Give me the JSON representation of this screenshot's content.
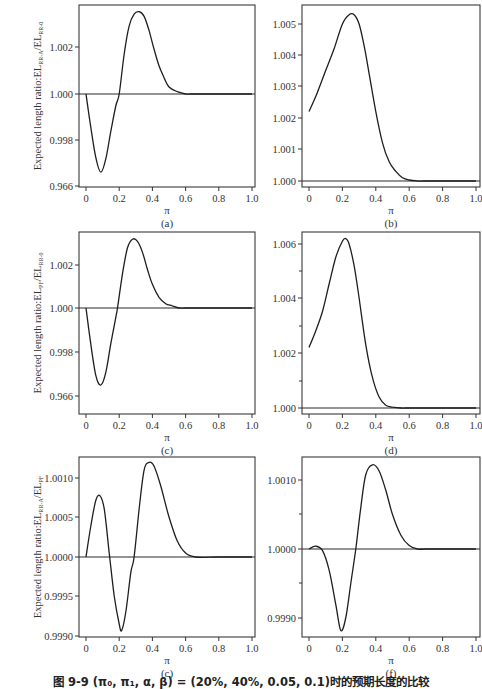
{
  "caption": "图 9-9 (π₀, π₁, α, β) = (20%, 40%, 0.05, 0.1)时的预期长度的比较",
  "chart_data": [
    {
      "id": "a",
      "type": "line",
      "panel_label": "(a)",
      "xlabel": "π",
      "ylabel": "Expected length ratio:EL_RR-A/EL_RR-0",
      "xlim": [
        0,
        1.0
      ],
      "xticks": [
        "0",
        "0.2",
        "0.4",
        "0.6",
        "0.8",
        "1.0"
      ],
      "yticks": [
        "0.966",
        "0.998",
        "1.000",
        "1.002"
      ],
      "reference_line": 1.0,
      "series": [
        {
          "name": "ratio",
          "x": [
            0,
            0.03,
            0.06,
            0.09,
            0.12,
            0.15,
            0.18,
            0.2,
            0.23,
            0.26,
            0.29,
            0.32,
            0.35,
            0.38,
            0.41,
            0.44,
            0.47,
            0.5,
            0.55,
            0.6,
            0.63,
            0.7,
            0.8,
            1.0
          ],
          "y": [
            1.0,
            0.9985,
            0.9972,
            0.9966,
            0.9972,
            0.9984,
            0.9995,
            1.0,
            1.0017,
            1.0029,
            1.0034,
            1.0035,
            1.0033,
            1.0027,
            1.0019,
            1.0012,
            1.0007,
            1.0003,
            1.0001,
            1.0,
            1.0,
            1.0,
            1.0,
            1.0
          ]
        }
      ]
    },
    {
      "id": "b",
      "type": "line",
      "panel_label": "(b)",
      "xlabel": "π",
      "ylabel": "",
      "xlim": [
        0,
        1.0
      ],
      "xticks": [
        "0",
        "0.2",
        "0.4",
        "0.6",
        "0.8",
        "1.0"
      ],
      "yticks": [
        "1.000",
        "1.001",
        "1.002",
        "1.003",
        "1.004",
        "1.005"
      ],
      "reference_line": 1.0,
      "series": [
        {
          "name": "ratio",
          "x": [
            0,
            0.05,
            0.1,
            0.15,
            0.2,
            0.24,
            0.27,
            0.3,
            0.33,
            0.36,
            0.4,
            0.44,
            0.48,
            0.52,
            0.56,
            0.6,
            0.65,
            0.7,
            1.0
          ],
          "y": [
            1.0022,
            1.0028,
            1.0035,
            1.0042,
            1.005,
            1.0053,
            1.0053,
            1.005,
            1.0043,
            1.0034,
            1.0022,
            1.0012,
            1.0006,
            1.0003,
            1.0001,
            1.00003,
            1.0,
            1.0,
            1.0
          ]
        }
      ]
    },
    {
      "id": "c",
      "type": "line",
      "panel_label": "(c)",
      "xlabel": "π",
      "ylabel": "Expected length ratio:EL_PF/EL_RR-0",
      "xlim": [
        0,
        1.0
      ],
      "xticks": [
        "0",
        "0.2",
        "0.4",
        "0.6",
        "0.8",
        "1.0"
      ],
      "yticks": [
        "0.966",
        "0.998",
        "1.000",
        "1.002"
      ],
      "reference_line": 1.0,
      "series": [
        {
          "name": "ratio",
          "x": [
            0,
            0.03,
            0.06,
            0.09,
            0.12,
            0.15,
            0.18,
            0.19,
            0.22,
            0.25,
            0.28,
            0.31,
            0.34,
            0.37,
            0.4,
            0.44,
            0.48,
            0.52,
            0.56,
            0.6,
            0.7,
            0.8,
            1.0
          ],
          "y": [
            1.0,
            0.9983,
            0.9969,
            0.9965,
            0.9971,
            0.9984,
            0.9996,
            1.0,
            1.0016,
            1.0028,
            1.0032,
            1.0031,
            1.0026,
            1.0018,
            1.0011,
            1.0005,
            1.0002,
            1.0001,
            1.0,
            1.0,
            1.0,
            1.0,
            1.0
          ]
        }
      ]
    },
    {
      "id": "d",
      "type": "line",
      "panel_label": "(d)",
      "xlabel": "π",
      "ylabel": "",
      "xlim": [
        0,
        1.0
      ],
      "xticks": [
        "0",
        "0.2",
        "0.4",
        "0.6",
        "0.8",
        "1.0"
      ],
      "yticks": [
        "1.000",
        "1.002",
        "1.004",
        "1.006"
      ],
      "reference_line": 1.0,
      "series": [
        {
          "name": "ratio",
          "x": [
            0,
            0.04,
            0.08,
            0.12,
            0.16,
            0.2,
            0.22,
            0.24,
            0.27,
            0.3,
            0.34,
            0.38,
            0.42,
            0.46,
            0.5,
            0.55,
            0.58,
            0.65,
            1.0
          ],
          "y": [
            1.0022,
            1.0028,
            1.0035,
            1.0045,
            1.0055,
            1.0061,
            1.0062,
            1.006,
            1.0052,
            1.004,
            1.0023,
            1.0011,
            1.0004,
            1.0001,
            1.00003,
            1.0,
            1.0,
            1.0,
            1.0
          ]
        }
      ]
    },
    {
      "id": "e",
      "type": "line",
      "panel_label": "(c)",
      "xlabel": "π",
      "ylabel": "Expected length ratio:EL_RR-A/EL_PF",
      "xlim": [
        0,
        1.0
      ],
      "xticks": [
        "0",
        "0.2",
        "0.4",
        "0.6",
        "0.8",
        "1.0"
      ],
      "yticks": [
        "0.9990",
        "0.9995",
        "1.0000",
        "1.0005",
        "1.0010"
      ],
      "reference_line": 1.0,
      "series": [
        {
          "name": "ratio",
          "x": [
            0,
            0.03,
            0.06,
            0.085,
            0.11,
            0.14,
            0.17,
            0.2,
            0.215,
            0.24,
            0.27,
            0.29,
            0.32,
            0.35,
            0.38,
            0.41,
            0.45,
            0.5,
            0.55,
            0.6,
            0.66,
            0.8,
            1.0
          ],
          "y": [
            1.0,
            1.0004,
            1.00072,
            1.00077,
            1.0006,
            1.00005,
            0.9995,
            0.99915,
            0.99907,
            0.9993,
            0.9998,
            1.0,
            1.0006,
            1.0011,
            1.0012,
            1.00115,
            1.0009,
            1.0005,
            1.0002,
            1.00005,
            1.0,
            1.0,
            1.0
          ]
        }
      ]
    },
    {
      "id": "f",
      "type": "line",
      "panel_label": "(f)",
      "xlabel": "π",
      "ylabel": "",
      "xlim": [
        0,
        1.0
      ],
      "xticks": [
        "0",
        "0.2",
        "0.4",
        "0.6",
        "0.8",
        "1.0"
      ],
      "yticks": [
        "0.9990",
        "1.0000",
        "1.0010"
      ],
      "reference_line": 1.0,
      "series": [
        {
          "name": "ratio",
          "x": [
            0,
            0.04,
            0.08,
            0.12,
            0.16,
            0.19,
            0.22,
            0.25,
            0.28,
            0.31,
            0.34,
            0.38,
            0.42,
            0.46,
            0.5,
            0.55,
            0.6,
            0.65,
            0.7,
            1.0
          ],
          "y": [
            1.0,
            1.00004,
            0.99998,
            0.9997,
            0.9992,
            0.99882,
            0.999,
            0.9995,
            1.0,
            1.0006,
            1.00108,
            1.00122,
            1.00113,
            1.00085,
            1.0005,
            1.0002,
            1.00005,
            1.0,
            1.0,
            1.0
          ]
        }
      ]
    }
  ],
  "labels": {
    "a": {
      "panel": "(a)",
      "x": "π",
      "y_main": "Expected length ratio:EL",
      "y_sub1": "RR-A",
      "y_mid": "/EL",
      "y_sub2": "RR-0"
    },
    "b": {
      "panel": "(b)",
      "x": "π"
    },
    "c": {
      "panel": "(c)",
      "x": "π",
      "y_main": "Expected length ratio:EL",
      "y_sub1": "PF",
      "y_mid": "/EL",
      "y_sub2": "RR-0"
    },
    "d": {
      "panel": "(d)",
      "x": "π"
    },
    "e": {
      "panel": "(c)",
      "x": "π",
      "y_main": "Expected length ratio:EL",
      "y_sub1": "RR-A",
      "y_mid": "/EL",
      "y_sub2": "PF"
    },
    "f": {
      "panel": "(f)",
      "x": "π"
    }
  }
}
